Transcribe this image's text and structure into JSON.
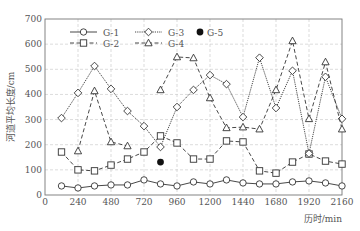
{
  "chart_data": {
    "type": "line",
    "title": "",
    "xlabel": "历时/min",
    "ylabel": "河道平均长度/cm",
    "xlim": [
      0,
      2160
    ],
    "ylim": [
      0,
      700
    ],
    "xticks": [
      0,
      240,
      480,
      720,
      960,
      1200,
      1440,
      1680,
      1920,
      2160
    ],
    "yticks": [
      0,
      100,
      200,
      300,
      400,
      500,
      600,
      700
    ],
    "grid": true,
    "legend_position": "upper left inside",
    "series": [
      {
        "name": "G-1",
        "marker": "circle",
        "line": "solid",
        "x": [
          120,
          240,
          360,
          480,
          600,
          720,
          840,
          960,
          1080,
          1200,
          1320,
          1440,
          1560,
          1680,
          1800,
          1920,
          2040,
          2160
        ],
        "values": [
          36,
          28,
          36,
          40,
          40,
          60,
          44,
          36,
          52,
          44,
          60,
          48,
          44,
          44,
          52,
          56,
          48,
          36
        ]
      },
      {
        "name": "G-2",
        "marker": "square",
        "line": "dashed",
        "x": [
          120,
          240,
          360,
          480,
          600,
          720,
          840,
          960,
          1080,
          1200,
          1320,
          1440,
          1560,
          1680,
          1800,
          1920,
          2040,
          2160
        ],
        "values": [
          171,
          100,
          96,
          119,
          143,
          171,
          235,
          207,
          143,
          143,
          215,
          211,
          96,
          87,
          131,
          163,
          135,
          123
        ]
      },
      {
        "name": "G-3",
        "marker": "diamond",
        "line": "dotted",
        "x": [
          120,
          240,
          360,
          480,
          600,
          720,
          840,
          960,
          1080,
          1200,
          1320,
          1440,
          1560,
          1680,
          1800,
          1920,
          2040,
          2160
        ],
        "values": [
          306,
          406,
          513,
          422,
          334,
          274,
          191,
          350,
          418,
          477,
          441,
          310,
          546,
          346,
          494,
          165,
          470,
          303
        ]
      },
      {
        "name": "G-4",
        "marker": "triangle",
        "line": "dashed",
        "segments": [
          {
            "x": [
              240,
              360,
              480,
              600
            ],
            "values": [
              175,
              414,
              211,
              195
            ]
          },
          {
            "x": [
              840,
              960,
              1080,
              1200,
              1320,
              1440,
              1560,
              1680,
              1800,
              1920,
              2040,
              2160
            ],
            "values": [
              418,
              549,
              545,
              386,
              267,
              270,
              262,
              418,
              613,
              303,
              529,
              262
            ]
          }
        ]
      },
      {
        "name": "G-5",
        "marker": "filled-circle",
        "line": "none",
        "x": [
          840
        ],
        "values": [
          131
        ]
      }
    ]
  }
}
